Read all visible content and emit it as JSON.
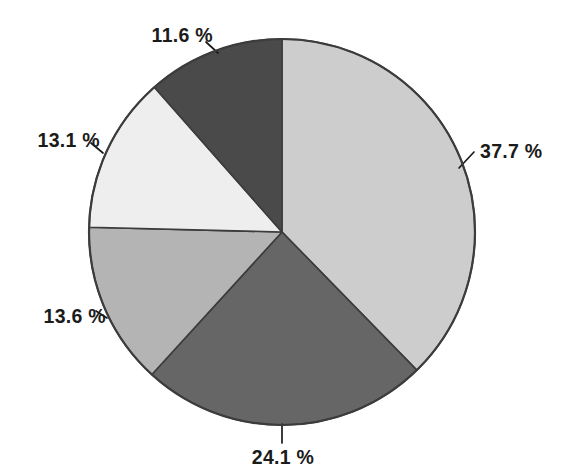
{
  "chart_data": {
    "type": "pie",
    "title": "",
    "subtitle": "",
    "xlabel": "",
    "ylabel": "",
    "grid": false,
    "legend": "none",
    "label_format": "{value} %",
    "unit": "%",
    "start_angle_deg": 0,
    "direction": "clockwise",
    "center": {
      "x": 282,
      "y": 232
    },
    "radius": 193,
    "categories": [
      "37.7 %",
      "24.1 %",
      "13.6 %",
      "13.1 %",
      "11.6 %"
    ],
    "values": [
      37.7,
      24.1,
      13.6,
      13.1,
      11.6
    ],
    "total": 100.1,
    "slices": [
      {
        "label": "37.7 %",
        "value": 37.7,
        "color": "#cdcdcd",
        "start_angle": 0.0,
        "end_angle": 135.7,
        "label_x": 480,
        "label_y": 142,
        "label_align": "lbl-right",
        "leader_from": {
          "x": 459,
          "y": 168
        },
        "leader_to": {
          "x": 474,
          "y": 152
        }
      },
      {
        "label": "24.1 %",
        "value": 24.1,
        "color": "#666666",
        "start_angle": 135.7,
        "end_angle": 222.4,
        "label_x": 283,
        "label_y": 448,
        "label_align": "lbl-center",
        "leader_from": {
          "x": 282,
          "y": 424
        },
        "leader_to": {
          "x": 282,
          "y": 443
        }
      },
      {
        "label": "13.6 %",
        "value": 13.6,
        "color": "#b4b4b4",
        "start_angle": 222.4,
        "end_angle": 271.4,
        "label_x": 106,
        "label_y": 307,
        "label_align": "lbl-left",
        "leader_from": {
          "x": 107,
          "y": 318
        },
        "leader_to": {
          "x": 96,
          "y": 311
        }
      },
      {
        "label": "13.1 %",
        "value": 13.1,
        "color": "#eeeeee",
        "start_angle": 271.4,
        "end_angle": 318.6,
        "label_x": 100,
        "label_y": 131,
        "label_align": "lbl-left",
        "leader_from": {
          "x": 103,
          "y": 153
        },
        "leader_to": {
          "x": 91,
          "y": 143
        }
      },
      {
        "label": "11.6 %",
        "value": 11.6,
        "color": "#4a4a4a",
        "start_angle": 318.6,
        "end_angle": 360.0,
        "label_x": 213,
        "label_y": 26,
        "label_align": "lbl-left",
        "leader_from": {
          "x": 218,
          "y": 53
        },
        "leader_to": {
          "x": 206,
          "y": 42
        }
      }
    ],
    "outline_color": "#3c3c3c",
    "background": "#ffffff",
    "text_color": "#1b1b1b"
  }
}
